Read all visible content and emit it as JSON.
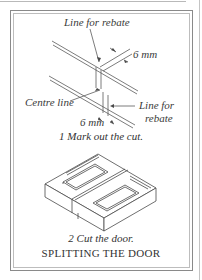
{
  "figure": {
    "title": "SPLITTING THE DOOR",
    "step1": {
      "caption": "1  Mark out the cut.",
      "labels": {
        "top_rebate": "Line for rebate",
        "top_measure": "6 mm",
        "centre_line": "Centre line",
        "right_rebate_line1": "Line for",
        "right_rebate_line2": "rebate",
        "bottom_measure": "6 mm"
      }
    },
    "step2": {
      "caption": "2  Cut the door."
    }
  },
  "colors": {
    "line": "#5a5a5a",
    "frame_outer": "#8a8a8a",
    "frame_inner": "#bdbdbd",
    "text": "#333333"
  }
}
